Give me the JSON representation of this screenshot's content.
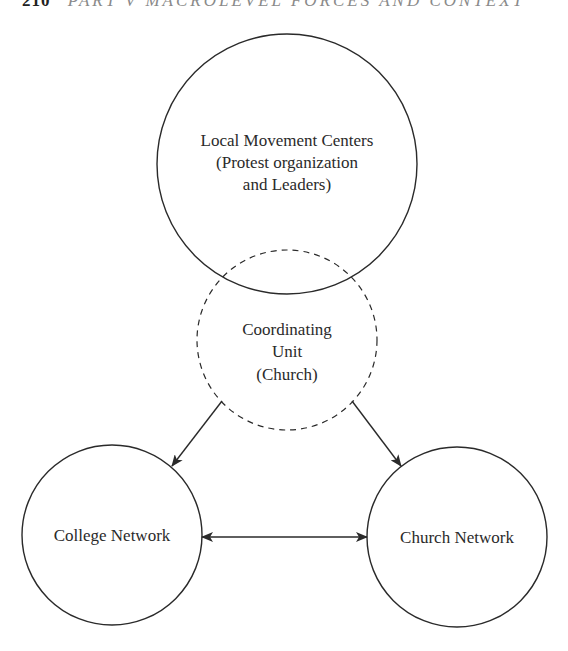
{
  "running_head": {
    "page_number": "210",
    "text": "PART V MACROLEVEL FORCES AND CONTEXT"
  },
  "colors": {
    "stroke": "#2a2a2a",
    "text": "#2a2a2a",
    "background": "#ffffff"
  },
  "nodes": [
    {
      "id": "local-movement-centers",
      "style": "solid",
      "lines": [
        "Local Movement Centers",
        "(Protest organization",
        "and Leaders)"
      ]
    },
    {
      "id": "coordinating-unit",
      "style": "dashed",
      "lines": [
        "Coordinating",
        "Unit",
        "(Church)"
      ]
    },
    {
      "id": "college-network",
      "style": "solid",
      "lines": [
        "College Network"
      ]
    },
    {
      "id": "church-network",
      "style": "solid",
      "lines": [
        "Church Network"
      ]
    }
  ],
  "edges": [
    {
      "from": "coordinating-unit",
      "to": "college-network",
      "direction": "forward"
    },
    {
      "from": "coordinating-unit",
      "to": "church-network",
      "direction": "forward"
    },
    {
      "from": "college-network",
      "to": "church-network",
      "direction": "both"
    }
  ]
}
